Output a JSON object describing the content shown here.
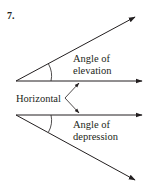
{
  "figure": {
    "number": "7.",
    "labels": {
      "elevation_line1": "Angle of",
      "elevation_line2": "elevation",
      "horizontal": "Horizontal",
      "depression_line1": "Angle of",
      "depression_line2": "depression"
    },
    "colors": {
      "line": "#231f20",
      "background": "#ffffff"
    }
  }
}
